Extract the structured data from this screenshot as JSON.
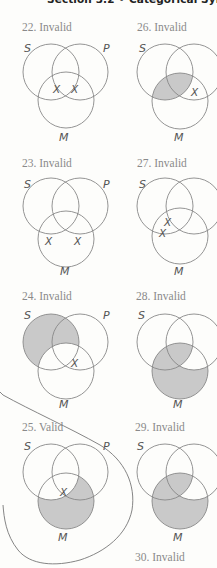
{
  "header": {
    "title": "Section 3.2 • Categorical Syllogi"
  },
  "colors": {
    "shading": "#c9c9c9",
    "circle_stroke": "#888888",
    "label_text": "#8a8a8a"
  },
  "circle_labels": {
    "s": "S",
    "p": "P",
    "m": "M",
    "x": "X"
  },
  "diagrams": [
    {
      "number": "22",
      "label": "22. Invalid",
      "shaded": [],
      "x_marks": 2
    },
    {
      "number": "23",
      "label": "23. Invalid",
      "shaded": [],
      "x_marks": 2
    },
    {
      "number": "24",
      "label": "24. Invalid",
      "shaded": [
        "S-outside-M"
      ],
      "x_marks": 1
    },
    {
      "number": "25",
      "label": "25. Valid",
      "shaded": [
        "M-outside-S"
      ],
      "x_marks": 1
    },
    {
      "number": "26",
      "label": "26. Invalid",
      "shaded": [
        "S-and-M"
      ],
      "x_marks": 1
    },
    {
      "number": "27",
      "label": "27. Invalid",
      "shaded": [],
      "x_marks": 2
    },
    {
      "number": "28",
      "label": "28. Invalid",
      "shaded": [
        "M-except-P-only"
      ],
      "x_marks": 0
    },
    {
      "number": "29",
      "label": "29. Invalid",
      "shaded": [
        "M-except-P-only"
      ],
      "x_marks": 0
    },
    {
      "number": "30",
      "label": "30. Invalid",
      "shaded": [],
      "x_marks": 0
    }
  ]
}
